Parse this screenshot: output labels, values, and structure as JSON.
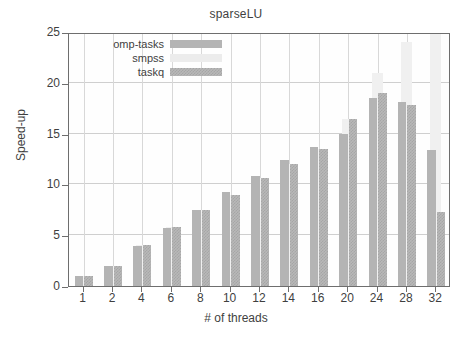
{
  "chart_data": {
    "type": "bar",
    "title": "sparseLU",
    "xlabel": "# of threads",
    "ylabel": "Speed-up",
    "ylim": [
      0,
      25
    ],
    "ytick_values": [
      0,
      5,
      10,
      15,
      20,
      25
    ],
    "ytick_labels": [
      "0",
      "5",
      "10",
      "15",
      "20",
      "25"
    ],
    "grid": true,
    "legend_position": "top-left inside",
    "categories": [
      "1",
      "2",
      "4",
      "6",
      "8",
      "10",
      "12",
      "14",
      "16",
      "20",
      "24",
      "28",
      "32"
    ],
    "series": [
      {
        "name": "omp-tasks",
        "color": "#b4b4b4",
        "values": [
          0.95,
          1.95,
          3.9,
          5.7,
          7.5,
          9.3,
          10.8,
          12.4,
          13.7,
          15.0,
          18.5,
          18.1,
          13.4
        ]
      },
      {
        "name": "smpss",
        "color": "#f0f0f0",
        "values": [
          1.0,
          2.0,
          4.0,
          5.8,
          7.5,
          9.0,
          10.6,
          12.05,
          13.5,
          16.4,
          21.0,
          24.0,
          25.0
        ]
      },
      {
        "name": "taskq",
        "color": "#b8b8b8",
        "values": [
          1.0,
          2.0,
          4.0,
          5.8,
          7.5,
          9.0,
          10.6,
          12.05,
          13.5,
          16.4,
          19.0,
          17.8,
          7.3
        ]
      }
    ]
  }
}
